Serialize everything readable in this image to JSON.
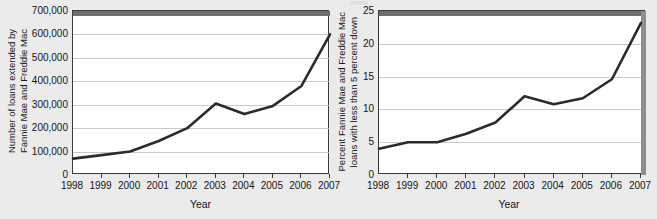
{
  "figure": {
    "background_color": "#ebebeb",
    "line_color": "#2b2b2b",
    "grid_color": "#c9c9c9",
    "frame_color": "#3b3b3b"
  },
  "chart_data": [
    {
      "type": "line",
      "panel": "left",
      "title": "",
      "xlabel": "Year",
      "ylabel": "Number of loans extended by\nFannie Mae and Freddie Mac",
      "categories": [
        "1998",
        "1999",
        "2000",
        "2001",
        "2002",
        "2003",
        "2004",
        "2005",
        "2006",
        "2007"
      ],
      "x": [
        1998,
        1999,
        2000,
        2001,
        2002,
        2003,
        2004,
        2005,
        2006,
        2007
      ],
      "values": [
        70000,
        85000,
        100000,
        145000,
        200000,
        305000,
        260000,
        295000,
        380000,
        600000
      ],
      "ylim": [
        0,
        700000
      ],
      "xlim": [
        1998,
        2007
      ],
      "ytick_values": [
        0,
        100000,
        200000,
        300000,
        400000,
        500000,
        600000,
        700000
      ],
      "ytick_labels": [
        "0",
        "100,000",
        "200,000",
        "300,000",
        "400,000",
        "500,000",
        "600,000",
        "700,000"
      ],
      "xtick_labels": [
        "1998",
        "1999",
        "2000",
        "2001",
        "2002",
        "2003",
        "2004",
        "2005",
        "2006",
        "2007"
      ],
      "grid": "horizontal",
      "legend": "none"
    },
    {
      "type": "line",
      "panel": "right",
      "title": "",
      "xlabel": "Year",
      "ylabel": "Percent Fannie Mae and Freddie Mac\nloans with less than 5 percent down",
      "categories": [
        "1998",
        "1999",
        "2000",
        "2001",
        "2002",
        "2003",
        "2004",
        "2005",
        "2006",
        "2007"
      ],
      "x": [
        1998,
        1999,
        2000,
        2001,
        2002,
        2003,
        2004,
        2005,
        2006,
        2007
      ],
      "values": [
        4.0,
        5.0,
        5.0,
        6.3,
        8.0,
        12.0,
        10.8,
        11.7,
        14.6,
        23.2
      ],
      "ylim": [
        0,
        25
      ],
      "xlim": [
        1998,
        2007
      ],
      "ytick_values": [
        0,
        5,
        10,
        15,
        20,
        25
      ],
      "ytick_labels": [
        "0",
        "5",
        "10",
        "15",
        "20",
        "25"
      ],
      "xtick_labels": [
        "1998",
        "1999",
        "2000",
        "2001",
        "2002",
        "2003",
        "2004",
        "2005",
        "2006",
        "2007"
      ],
      "grid": "horizontal",
      "legend": "none"
    }
  ]
}
